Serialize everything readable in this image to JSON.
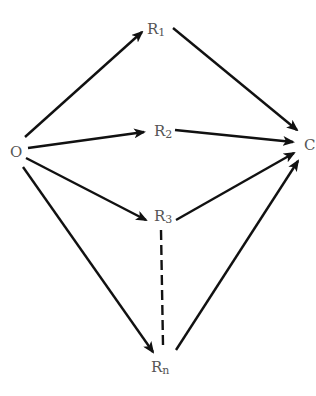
{
  "diagram": {
    "type": "directed-graph",
    "nodes": {
      "O": {
        "id": "O",
        "label": "O",
        "sub": "",
        "x": 18,
        "y": 151
      },
      "R1": {
        "id": "R1",
        "label": "R",
        "sub": "1",
        "x": 148,
        "y": 34
      },
      "R2": {
        "id": "R2",
        "label": "R",
        "sub": "2",
        "x": 155,
        "y": 136
      },
      "R3": {
        "id": "R3",
        "label": "R",
        "sub": "3",
        "x": 155,
        "y": 221
      },
      "Rn": {
        "id": "Rn",
        "label": "R",
        "sub": "n",
        "x": 152,
        "y": 372
      },
      "C": {
        "id": "C",
        "label": "C",
        "sub": "",
        "x": 306,
        "y": 150
      }
    },
    "edges": [
      {
        "from": "O",
        "to": "R1",
        "style": "solid",
        "arrow": true
      },
      {
        "from": "R1",
        "to": "C",
        "style": "solid",
        "arrow": true
      },
      {
        "from": "O",
        "to": "R2",
        "style": "solid",
        "arrow": true
      },
      {
        "from": "R2",
        "to": "C",
        "style": "solid",
        "arrow": true
      },
      {
        "from": "O",
        "to": "R3",
        "style": "solid",
        "arrow": true
      },
      {
        "from": "R3",
        "to": "C",
        "style": "solid",
        "arrow": true
      },
      {
        "from": "O",
        "to": "Rn",
        "style": "solid",
        "arrow": true
      },
      {
        "from": "Rn",
        "to": "C",
        "style": "solid",
        "arrow": true
      },
      {
        "from": "R3",
        "to": "Rn",
        "style": "dashed",
        "arrow": false
      }
    ],
    "colors": {
      "edge": "#111111",
      "label": "#555555",
      "background": "#ffffff"
    }
  }
}
